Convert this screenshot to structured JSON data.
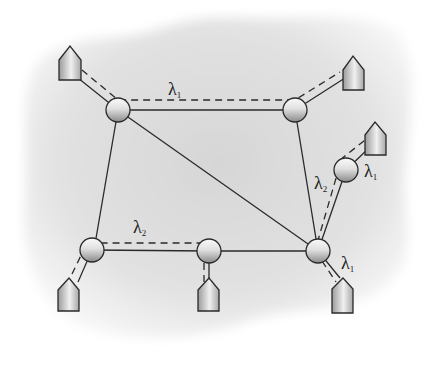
{
  "diagram": {
    "type": "optical-network-wavelength-routing",
    "colors": {
      "cloud": "#e4e4e4",
      "line": "#2a2a2a",
      "node_light": "#f2f2f2",
      "node_dark": "#8c8c8c"
    },
    "nodes": [
      {
        "id": "A",
        "x": 118,
        "y": 110,
        "r": 12
      },
      {
        "id": "B",
        "x": 295,
        "y": 110,
        "r": 12
      },
      {
        "id": "C",
        "x": 346,
        "y": 170,
        "r": 12
      },
      {
        "id": "D",
        "x": 318,
        "y": 251,
        "r": 12
      },
      {
        "id": "E",
        "x": 92,
        "y": 250,
        "r": 12
      },
      {
        "id": "F",
        "x": 209,
        "y": 251,
        "r": 12
      }
    ],
    "hosts": [
      {
        "id": "h1",
        "x": 70,
        "y": 64,
        "attached": "A"
      },
      {
        "id": "h2",
        "x": 353,
        "y": 70,
        "attached": "B"
      },
      {
        "id": "h3",
        "x": 375,
        "y": 136,
        "attached": "C"
      },
      {
        "id": "h4",
        "x": 68,
        "y": 297,
        "attached": "E"
      },
      {
        "id": "h5",
        "x": 209,
        "y": 297,
        "attached": "F"
      },
      {
        "id": "h6",
        "x": 343,
        "y": 298,
        "attached": "D"
      }
    ],
    "links": [
      [
        "A",
        "B"
      ],
      [
        "A",
        "E"
      ],
      [
        "A",
        "D"
      ],
      [
        "B",
        "D"
      ],
      [
        "C",
        "D"
      ],
      [
        "E",
        "F"
      ],
      [
        "F",
        "D"
      ]
    ],
    "lightpaths": [
      {
        "label": "λ",
        "sub": "1",
        "path": "h1-A-B-h2"
      },
      {
        "label": "λ",
        "sub": "2",
        "path": "h4-E-F-h5"
      },
      {
        "label": "λ",
        "sub": "2",
        "path": "D-C"
      },
      {
        "label": "λ",
        "sub": "1",
        "path": "C-h3"
      },
      {
        "label": "λ",
        "sub": "1",
        "path": "D-h6"
      }
    ],
    "labels": [
      {
        "text": "λ",
        "sub": "1",
        "x": 150,
        "y": 84
      },
      {
        "text": "λ",
        "sub": "2",
        "x": 133,
        "y": 226
      },
      {
        "text": "λ",
        "sub": "2",
        "x": 314,
        "y": 174
      },
      {
        "text": "λ",
        "sub": "1",
        "x": 364,
        "y": 161
      },
      {
        "text": "λ",
        "sub": "1",
        "x": 341,
        "y": 256
      }
    ]
  }
}
